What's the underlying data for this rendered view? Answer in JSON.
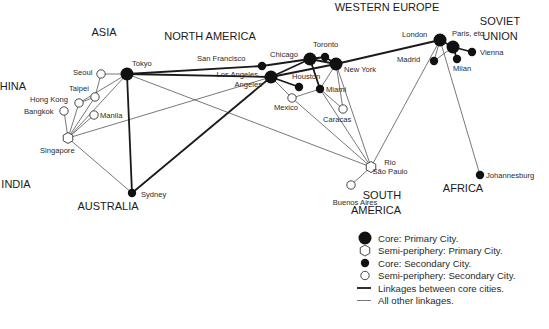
{
  "regions": [
    {
      "id": "asia",
      "label": "ASIA",
      "x": 104,
      "y": 36
    },
    {
      "id": "china",
      "label": "CHINA",
      "x": 9,
      "y": 90
    },
    {
      "id": "india",
      "label": "INDIA",
      "x": 16,
      "y": 188
    },
    {
      "id": "australia",
      "label": "AUSTRALIA",
      "x": 108,
      "y": 210
    },
    {
      "id": "north-america",
      "label": "NORTH AMERICA",
      "x": 210,
      "y": 40
    },
    {
      "id": "western-europe",
      "label": "WESTERN EUROPE",
      "x": 387,
      "y": 11
    },
    {
      "id": "soviet-line1",
      "label": "SOVIET",
      "x": 500,
      "y": 25
    },
    {
      "id": "soviet-line2",
      "label": "UNION",
      "x": 500,
      "y": 40
    },
    {
      "id": "south-america-line1",
      "label": "SOUTH",
      "x": 382,
      "y": 199
    },
    {
      "id": "south-america-line2",
      "label": "AMERICA",
      "x": 376,
      "y": 214
    },
    {
      "id": "africa",
      "label": "AFRICA",
      "x": 463,
      "y": 192
    }
  ],
  "cities": [
    {
      "id": "tokyo",
      "label": "Tokyo",
      "type": "core-primary",
      "x": 127,
      "y": 74,
      "lx": 132,
      "ly": 66,
      "anchor": "start"
    },
    {
      "id": "seoul",
      "label": "Seoul",
      "type": "semi-secondary",
      "x": 101,
      "y": 74,
      "lx": 73,
      "ly": 75,
      "anchor": "start"
    },
    {
      "id": "taipei",
      "label": "Taipei",
      "type": "semi-secondary",
      "x": 95,
      "y": 97,
      "lx": 69,
      "ly": 91,
      "anchor": "start"
    },
    {
      "id": "hong-kong",
      "label": "Hong Kong",
      "type": "semi-secondary",
      "x": 79,
      "y": 103,
      "lx": 30,
      "ly": 102,
      "anchor": "start"
    },
    {
      "id": "bangkok",
      "label": "Bangkok",
      "type": "semi-secondary",
      "x": 64,
      "y": 111,
      "lx": 24,
      "ly": 114,
      "anchor": "start"
    },
    {
      "id": "manila",
      "label": "Manila",
      "type": "semi-secondary",
      "x": 94,
      "y": 115,
      "lx": 100,
      "ly": 118,
      "anchor": "start"
    },
    {
      "id": "singapore",
      "label": "Singapore",
      "type": "semi-primary",
      "x": 68,
      "y": 138,
      "lx": 40,
      "ly": 153,
      "anchor": "start"
    },
    {
      "id": "sydney",
      "label": "Sydney",
      "type": "core-secondary",
      "x": 132,
      "y": 193,
      "lx": 141,
      "ly": 197,
      "anchor": "start"
    },
    {
      "id": "san-francisco",
      "label": "San Francisco",
      "type": "core-secondary",
      "x": 262,
      "y": 66,
      "lx": 197,
      "ly": 61,
      "anchor": "start"
    },
    {
      "id": "los-angeles",
      "label": "Los Angeles",
      "type": "core-primary",
      "x": 271,
      "y": 77,
      "lx": 258,
      "ly": 77,
      "anchor": "end",
      "label2": "Angeles",
      "lx2": 262,
      "ly2": 87
    },
    {
      "id": "chicago",
      "label": "Chicago",
      "type": "core-primary",
      "x": 310,
      "y": 59,
      "lx": 270,
      "ly": 57,
      "anchor": "start"
    },
    {
      "id": "toronto",
      "label": "Toronto",
      "type": "core-secondary",
      "x": 325,
      "y": 57,
      "lx": 313,
      "ly": 47,
      "anchor": "start"
    },
    {
      "id": "new-york",
      "label": "New York",
      "type": "core-primary",
      "x": 336,
      "y": 64,
      "lx": 344,
      "ly": 72,
      "anchor": "start"
    },
    {
      "id": "houston",
      "label": "Houston",
      "type": "core-secondary",
      "x": 299,
      "y": 87,
      "lx": 292,
      "ly": 79,
      "anchor": "start"
    },
    {
      "id": "miami",
      "label": "Miami",
      "type": "core-secondary",
      "x": 320,
      "y": 89,
      "lx": 326,
      "ly": 92,
      "anchor": "start"
    },
    {
      "id": "mexico",
      "label": "Mexico",
      "type": "semi-secondary",
      "x": 292,
      "y": 98,
      "lx": 274,
      "ly": 110,
      "anchor": "start"
    },
    {
      "id": "caracas",
      "label": "Caracas",
      "type": "semi-secondary",
      "x": 343,
      "y": 109,
      "lx": 323,
      "ly": 122,
      "anchor": "start"
    },
    {
      "id": "rio-sao-paulo",
      "label": "Rio",
      "type": "semi-primary",
      "x": 371,
      "y": 167,
      "lx": 390,
      "ly": 165,
      "anchor": "middle",
      "label2": "São Paulo",
      "lx2": 390,
      "ly2": 174
    },
    {
      "id": "buenos-aires",
      "label": "Buenos Aires",
      "type": "semi-secondary",
      "x": 351,
      "y": 185,
      "lx": 355,
      "ly": 205,
      "anchor": "middle"
    },
    {
      "id": "london",
      "label": "London",
      "type": "core-primary",
      "x": 440,
      "y": 40,
      "lx": 402,
      "ly": 37,
      "anchor": "start"
    },
    {
      "id": "paris",
      "label": "Paris, etc.",
      "type": "core-primary",
      "x": 453,
      "y": 47,
      "lx": 452,
      "ly": 36,
      "anchor": "start"
    },
    {
      "id": "madrid",
      "label": "Madrid",
      "type": "core-secondary",
      "x": 434,
      "y": 61,
      "lx": 397,
      "ly": 62,
      "anchor": "start"
    },
    {
      "id": "milan",
      "label": "Milan",
      "type": "core-secondary",
      "x": 457,
      "y": 59,
      "lx": 453,
      "ly": 71,
      "anchor": "start"
    },
    {
      "id": "vienna",
      "label": "Vienna",
      "type": "core-secondary",
      "x": 472,
      "y": 52,
      "lx": 480,
      "ly": 55,
      "anchor": "start"
    },
    {
      "id": "johannesburg",
      "label": "Johannesburg",
      "type": "core-secondary",
      "x": 480,
      "y": 175,
      "lx": 486,
      "ly": 178,
      "anchor": "start"
    }
  ],
  "links": {
    "core": [
      [
        "tokyo",
        "san-francisco"
      ],
      [
        "tokyo",
        "los-angeles"
      ],
      [
        "tokyo",
        "sydney"
      ],
      [
        "sydney",
        "los-angeles"
      ],
      [
        "san-francisco",
        "chicago"
      ],
      [
        "los-angeles",
        "chicago"
      ],
      [
        "los-angeles",
        "new-york"
      ],
      [
        "chicago",
        "toronto"
      ],
      [
        "toronto",
        "new-york"
      ],
      [
        "chicago",
        "new-york"
      ],
      [
        "chicago",
        "miami"
      ],
      [
        "los-angeles",
        "houston"
      ],
      [
        "new-york",
        "london"
      ],
      [
        "london",
        "paris"
      ],
      [
        "paris",
        "vienna"
      ],
      [
        "paris",
        "milan"
      ]
    ],
    "other": [
      [
        "tokyo",
        "seoul"
      ],
      [
        "tokyo",
        "singapore"
      ],
      [
        "tokyo",
        "hong-kong"
      ],
      [
        "tokyo",
        "rio-sao-paulo"
      ],
      [
        "seoul",
        "taipei"
      ],
      [
        "taipei",
        "hong-kong"
      ],
      [
        "hong-kong",
        "singapore"
      ],
      [
        "bangkok",
        "singapore"
      ],
      [
        "manila",
        "singapore"
      ],
      [
        "taipei",
        "singapore"
      ],
      [
        "singapore",
        "los-angeles"
      ],
      [
        "singapore",
        "sydney"
      ],
      [
        "los-angeles",
        "mexico"
      ],
      [
        "mexico",
        "miami"
      ],
      [
        "mexico",
        "rio-sao-paulo"
      ],
      [
        "miami",
        "caracas"
      ],
      [
        "new-york",
        "miami"
      ],
      [
        "new-york",
        "caracas"
      ],
      [
        "new-york",
        "rio-sao-paulo"
      ],
      [
        "miami",
        "rio-sao-paulo"
      ],
      [
        "rio-sao-paulo",
        "buenos-aires"
      ],
      [
        "london",
        "rio-sao-paulo"
      ],
      [
        "london",
        "johannesburg"
      ],
      [
        "london",
        "madrid"
      ],
      [
        "paris",
        "madrid"
      ]
    ]
  },
  "legend": {
    "items": [
      {
        "symbol": "core-primary",
        "label": "Core: Primary City."
      },
      {
        "symbol": "semi-primary",
        "label": "Semi-periphery: Primary City."
      },
      {
        "symbol": "core-secondary",
        "label": "Core: Secondary City."
      },
      {
        "symbol": "semi-secondary",
        "label": "Semi-periphery: Secondary City."
      },
      {
        "symbol": "core-link",
        "label": "Linkages between core cities."
      },
      {
        "symbol": "other-link",
        "label": "All other linkages."
      }
    ]
  },
  "colors": {
    "ink": "#111111",
    "core_line": "#1a1a1a",
    "other_line": "#555555",
    "fill_open": "#ffffff"
  }
}
